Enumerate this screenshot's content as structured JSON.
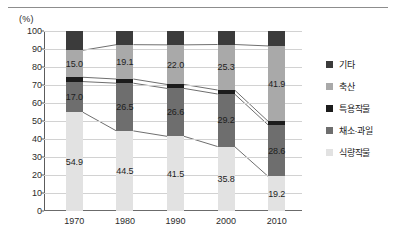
{
  "axis": {
    "unit_label": "(%)",
    "y_ticks": [
      "100",
      "90",
      "80",
      "70",
      "60",
      "50",
      "40",
      "30",
      "20",
      "10",
      "0"
    ],
    "x_ticks": [
      "1970",
      "1980",
      "1990",
      "2000",
      "2010"
    ]
  },
  "legend": {
    "items": [
      {
        "label": "기타",
        "color": "#3b3b3b"
      },
      {
        "label": "축산",
        "color": "#a9a9a9"
      },
      {
        "label": "특용작물",
        "color": "#1c1c1c"
      },
      {
        "label": "채소·과일",
        "color": "#6e6e6e"
      },
      {
        "label": "식량작물",
        "color": "#e2e2e2"
      }
    ]
  },
  "chart_data": {
    "type": "bar",
    "title": "",
    "xlabel": "",
    "ylabel": "(%)",
    "ylim": [
      0,
      100
    ],
    "ytick_step": 10,
    "grid": true,
    "stacked": true,
    "stack_mode": "100%",
    "legend_position": "right",
    "categories": [
      "1970",
      "1980",
      "1990",
      "2000",
      "2010"
    ],
    "series": [
      {
        "name": "식량작물",
        "color": "#e2e2e2",
        "values": [
          54.9,
          44.5,
          41.5,
          35.8,
          19.2
        ],
        "labels": [
          "54.9",
          "44.5",
          "41.5",
          "35.8",
          "19.2"
        ]
      },
      {
        "name": "채소·과일",
        "color": "#6e6e6e",
        "values": [
          17.0,
          26.5,
          26.6,
          29.2,
          28.6
        ],
        "labels": [
          "17.0",
          "26.5",
          "26.6",
          "29.2",
          "28.6"
        ]
      },
      {
        "name": "특용작물",
        "color": "#1c1c1c",
        "values": [
          2.4,
          2.3,
          2.2,
          2.2,
          2.0
        ],
        "labels": [
          "",
          "",
          "",
          "",
          ""
        ]
      },
      {
        "name": "축산",
        "color": "#a9a9a9",
        "values": [
          15.0,
          19.1,
          22.0,
          25.3,
          41.9
        ],
        "labels": [
          "15.0",
          "19.1",
          "22.0",
          "25.3",
          "41.9"
        ]
      },
      {
        "name": "기타",
        "color": "#3b3b3b",
        "values": [
          10.7,
          7.6,
          7.7,
          7.5,
          8.3
        ],
        "labels": [
          "",
          "",
          "",
          "",
          ""
        ]
      }
    ],
    "connector_lines": true,
    "annotations": []
  }
}
